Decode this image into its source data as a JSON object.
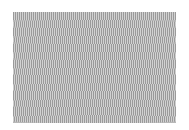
{
  "pattern": {
    "type": "vertical-stripe-moire",
    "colors": {
      "dark": "#9a9a9a",
      "light": "#d2d2d2",
      "background": "#ffffff"
    },
    "band_count": 14
  }
}
